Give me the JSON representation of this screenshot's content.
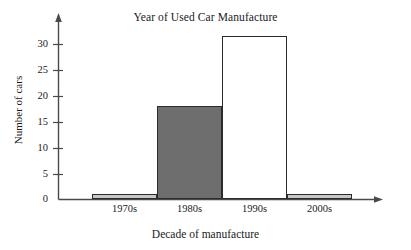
{
  "chart_data": {
    "type": "bar",
    "title": "Year of Used Car Manufacture",
    "xlabel": "Decade of manufacture",
    "ylabel": "Number of cars",
    "categories": [
      "1970s",
      "1980s",
      "1990s",
      "2000s"
    ],
    "values": [
      1,
      18,
      31.5,
      1
    ],
    "series": [
      {
        "name": "Number of cars",
        "values": [
          1,
          18,
          31.5,
          1
        ]
      }
    ],
    "bar_colors": [
      "#c8c8c8",
      "#6e6e6e",
      "#ffffff",
      "#c8c8c8"
    ],
    "bar_edge_color": "#2b2b2b",
    "ylim": [
      0,
      34
    ],
    "yticks": [
      0,
      5,
      10,
      15,
      20,
      25,
      30
    ],
    "ytick_labels": [
      "0",
      "5",
      "10",
      "15",
      "20",
      "25",
      "30"
    ],
    "grid": false,
    "legend": null,
    "axis_arrows": true
  },
  "axis_color": "#4a4a4a"
}
